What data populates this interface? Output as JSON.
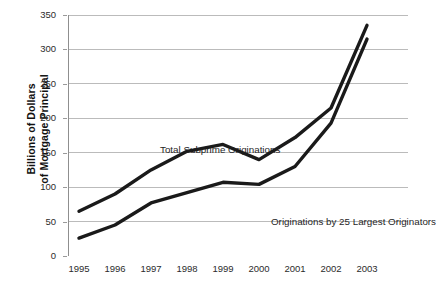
{
  "chart_data": {
    "type": "line",
    "title": "",
    "subtitle": "",
    "xlabel": "",
    "ylabel": "Billions of Dollars of Mortgage Principal",
    "ylabel_lines": [
      "Billions of Dollars",
      "of Mortgage Principal"
    ],
    "categories": [
      "1995",
      "1996",
      "1997",
      "1998",
      "1999",
      "2000",
      "2001",
      "2002",
      "2003"
    ],
    "x": [
      1995,
      1996,
      1997,
      1998,
      1999,
      2000,
      2001,
      2002,
      2003
    ],
    "series": [
      {
        "name": "Total Subprime Originations",
        "values": [
          65,
          90,
          125,
          152,
          162,
          140,
          172,
          215,
          335
        ],
        "color": "#1a1a1a",
        "line_width": 3.4
      },
      {
        "name": "Originations by 25 Largest Originators",
        "values": [
          26,
          45,
          77,
          92,
          107,
          104,
          130,
          193,
          315
        ],
        "color": "#1a1a1a",
        "line_width": 3.4
      }
    ],
    "ylim": [
      0,
      350
    ],
    "yticks": [
      0,
      50,
      100,
      150,
      200,
      250,
      300,
      350
    ],
    "ytick_labels": [
      "0",
      "50",
      "100",
      "150",
      "200",
      "250",
      "300",
      "350"
    ],
    "xtick_labels": [
      "1995",
      "1996",
      "1997",
      "1998",
      "1999",
      "2000",
      "2001",
      "2002",
      "2003"
    ],
    "grid": true,
    "grid_axis": "y",
    "grid_color": "#b4b4b4",
    "axis_color": "#8f8f8f",
    "legend": "none",
    "annotations": [
      {
        "text": "Total Subprime Originations",
        "series": "Total Subprime Originations"
      },
      {
        "text": "Originations by 25 Largest Originators",
        "series": "Originations by 25 Largest Originators"
      }
    ],
    "background_color": "#ffffff"
  }
}
